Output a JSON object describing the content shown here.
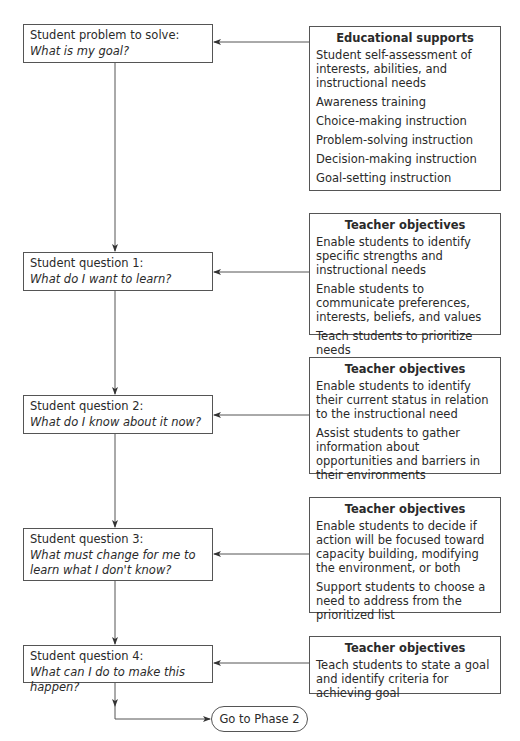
{
  "diagram": {
    "problem": {
      "label": "Student problem to solve:",
      "question": "What is my goal?"
    },
    "student_questions": [
      {
        "label": "Student question 1:",
        "question": "What do I want to learn?"
      },
      {
        "label": "Student question 2:",
        "question": "What do I know about it now?"
      },
      {
        "label": "Student question 3:",
        "question": "What must change for me to learn what I don't know?"
      },
      {
        "label": "Student question 4:",
        "question": "What can I do to make this happen?"
      }
    ],
    "educational_supports": {
      "title": "Educational supports",
      "items": [
        "Student self-assessment of interests, abilities, and instructional needs",
        "Awareness training",
        "Choice-making instruction",
        "Problem-solving instruction",
        "Decision-making instruction",
        "Goal-setting instruction"
      ]
    },
    "teacher_objectives": [
      {
        "title": "Teacher objectives",
        "items": [
          "Enable students to identify specific strengths and instructional needs",
          "Enable students to communicate preferences, interests, beliefs, and values",
          "Teach students to prioritize needs"
        ]
      },
      {
        "title": "Teacher objectives",
        "items": [
          "Enable students to identify their current status in relation to the instructional need",
          "Assist students to gather information about opportunities and barriers in their environments"
        ]
      },
      {
        "title": "Teacher objectives",
        "items": [
          "Enable students to decide if action will be focused toward capacity building, modifying the environment, or both",
          "Support students to choose a need to address from the prioritized list"
        ]
      },
      {
        "title": "Teacher objectives",
        "items": [
          "Teach students to state a goal and identify criteria for achieving goal"
        ]
      }
    ],
    "terminal": {
      "label": "Go to Phase 2"
    },
    "colors": {
      "line": "#555555",
      "text": "#2a2a2a",
      "background": "#ffffff"
    }
  }
}
